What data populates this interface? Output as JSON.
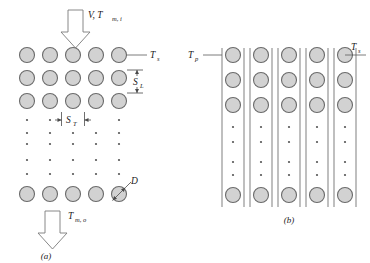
{
  "figure": {
    "panel_a": {
      "caption": "(a)",
      "inlet": {
        "symbol": "V, T",
        "sub": "m, i"
      },
      "outlet": {
        "symbol": "T",
        "sub": "m, o"
      },
      "surface_temp": {
        "symbol": "T",
        "sub": "s"
      },
      "longitudinal_pitch": {
        "symbol": "S",
        "sub": "L"
      },
      "transverse_pitch": {
        "symbol": "S",
        "sub": "T"
      },
      "diameter": {
        "symbol": "D",
        "sub": ""
      },
      "columns": 5,
      "top_rows": 3,
      "bottom_rows": 1,
      "dot_rows": 5
    },
    "panel_b": {
      "caption": "(b)",
      "plate_temp": {
        "symbol": "T",
        "sub": "p"
      },
      "surface_temp": {
        "symbol": "T",
        "sub": "s"
      },
      "channels": 5,
      "top_rows": 3,
      "bottom_rows": 1,
      "dot_rows": 4
    },
    "colors": {
      "tube_fill": "#d2d2d2",
      "tube_stroke": "#6a6a6a",
      "line": "#5a5a5a",
      "text": "#1a1a1a",
      "background": "#ffffff"
    }
  }
}
